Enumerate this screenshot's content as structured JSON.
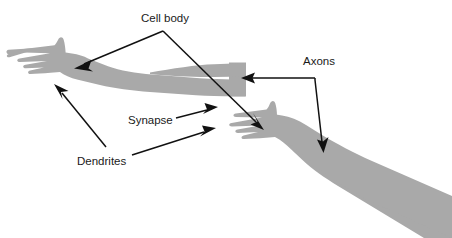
{
  "figure": {
    "background_color": "#ffffff",
    "limb_fill_color": "#a9a9a9",
    "line_color": "#111111",
    "text_color": "#1a1a1a",
    "width": 452,
    "height": 238
  },
  "labels": {
    "cell_body": "Cell body",
    "axons": "Axons",
    "synapse": "Synapse",
    "dendrites": "Dendrites"
  },
  "annotations": [
    {
      "id": "cell-body",
      "label": "Cell body",
      "text_x": 141,
      "text_y": 22,
      "points_to": [
        "upper-left-hand-palm",
        "lower-right-hand-palm"
      ],
      "arrow_count": 2
    },
    {
      "id": "axons",
      "label": "Axons",
      "text_x": 303,
      "text_y": 65,
      "points_to": [
        "upper-arm-cut-end",
        "lower-arm-forearm"
      ],
      "arrow_count": 2
    },
    {
      "id": "synapse",
      "label": "Synapse",
      "text_x": 128,
      "text_y": 124,
      "points_to": [
        "fingertip-gap-upper"
      ],
      "arrow_count": 1
    },
    {
      "id": "dendrites",
      "label": "Dendrites",
      "text_x": 77,
      "text_y": 165,
      "points_to": [
        "upper-hand-fingers",
        "lower-hand-fingers"
      ],
      "arrow_count": 2
    }
  ],
  "shapes": [
    {
      "id": "upper-left-arm",
      "name": "upper-arm-with-hand",
      "description": "Left hand with spread fingers and forearm extending right to a squared cut end"
    },
    {
      "id": "lower-right-arm",
      "name": "lower-arm-with-hand",
      "description": "Right hand with spread fingers and forearm extending to lower-right off the canvas edge"
    }
  ]
}
